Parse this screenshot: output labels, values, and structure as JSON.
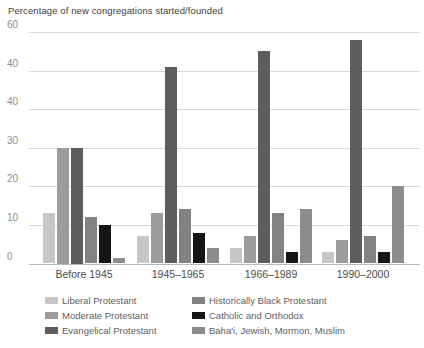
{
  "chart_data": {
    "type": "bar",
    "title": "Percentage of new congregations started/founded",
    "categories": [
      "Before 1945",
      "1945–1965",
      "1966–1989",
      "1990–2000"
    ],
    "series": [
      {
        "name": "Liberal Protestant",
        "color": "#c7c7c7",
        "values": [
          13,
          7,
          4,
          3
        ]
      },
      {
        "name": "Moderate Protestant",
        "color": "#9c9c9c",
        "values": [
          30,
          13,
          7,
          6
        ]
      },
      {
        "name": "Evangelical Protestant",
        "color": "#5d5d5d",
        "values": [
          30,
          51,
          55,
          58
        ]
      },
      {
        "name": "Historically Black Protestant",
        "color": "#828282",
        "values": [
          12,
          14,
          13,
          7
        ]
      },
      {
        "name": "Catholic and Orthodox",
        "color": "#161616",
        "values": [
          10,
          8,
          3,
          3
        ]
      },
      {
        "name": "Baha'i, Jewish, Mormon, Muslim",
        "color": "#8c8c8c",
        "values": [
          1.5,
          4,
          14,
          20
        ]
      }
    ],
    "y_axis": {
      "tick_labels_top_to_bottom": [
        "60",
        "40",
        "40",
        "30",
        "20",
        "10",
        "0"
      ],
      "max": 60
    },
    "ylim": [
      0,
      60
    ],
    "grid": true,
    "legend_position": "bottom",
    "legend_columns": [
      [
        "Liberal Protestant",
        "Moderate Protestant",
        "Evangelical Protestant"
      ],
      [
        "Historically Black Protestant",
        "Catholic and Orthodox",
        "Baha'i, Jewish, Mormon, Muslim"
      ]
    ]
  }
}
